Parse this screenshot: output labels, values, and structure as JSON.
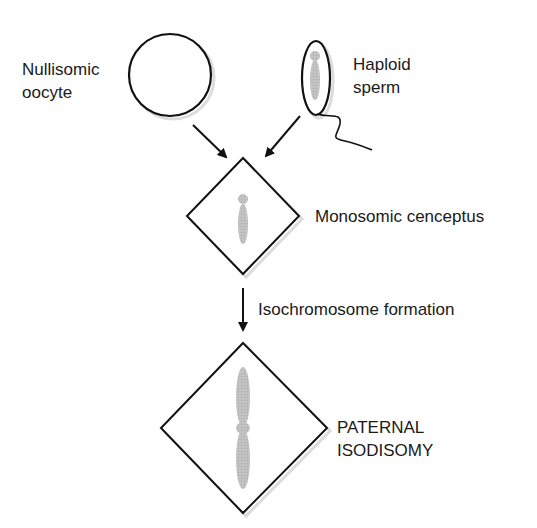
{
  "labels": {
    "oocyte_line1": "Nullisomic",
    "oocyte_line2": "oocyte",
    "sperm_line1": "Haploid",
    "sperm_line2": "sperm",
    "conceptus": "Monosomic cenceptus",
    "process": "Isochromosome formation",
    "result_line1": "PATERNAL",
    "result_line2": "ISODISOMY"
  },
  "colors": {
    "stroke": "#111111",
    "chromosome": "#bdbdbd",
    "shadow": "#d9d9d9"
  }
}
